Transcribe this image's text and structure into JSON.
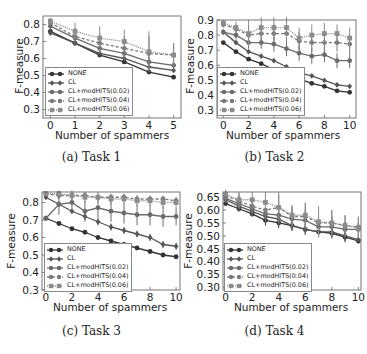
{
  "figure": {
    "xlabel": "Number of spammers",
    "ylabel": "F-measure",
    "legend": [
      "NONE",
      "CL",
      "CL+modHITS(0.02)",
      "CL+modHITS(0.04)",
      "CL+modHITS(0.06)"
    ],
    "series_styles": [
      {
        "color": "#333333",
        "marker": "circle",
        "dash": ""
      },
      {
        "color": "#555555",
        "marker": "diamond",
        "dash": ""
      },
      {
        "color": "#6b6b6b",
        "marker": "circle",
        "dash": ""
      },
      {
        "color": "#7a7a7a",
        "marker": "circle",
        "dash": "3,2"
      },
      {
        "color": "#8c8c8c",
        "marker": "square",
        "dash": "1,1"
      }
    ]
  },
  "panels": [
    {
      "caption": "(a) Task 1"
    },
    {
      "caption": "(b) Task 2"
    },
    {
      "caption": "(c) Task 3"
    },
    {
      "caption": "(d) Task 4"
    }
  ],
  "chart_data": [
    {
      "type": "line",
      "title": "(a) Task 1",
      "xlabel": "Number of spammers",
      "ylabel": "F-measure",
      "x": [
        0,
        1,
        2,
        3,
        4,
        5
      ],
      "xlim": [
        -0.3,
        5.3
      ],
      "xticks": [
        0,
        1,
        2,
        3,
        4,
        5
      ],
      "ylim": [
        0.25,
        0.85
      ],
      "yticks": [
        0.3,
        0.4,
        0.5,
        0.6,
        0.7,
        0.8
      ],
      "ytick_labels": [
        "0.3",
        "0.4",
        "0.5",
        "0.6",
        "0.7",
        "0.8"
      ],
      "legend_position": "lower left",
      "grid": false,
      "series": [
        {
          "name": "NONE",
          "values": [
            0.76,
            0.69,
            0.62,
            0.58,
            0.52,
            0.49
          ],
          "err": [
            0.01,
            0.01,
            0.01,
            0.01,
            0.01,
            0.01
          ]
        },
        {
          "name": "CL",
          "values": [
            0.75,
            0.69,
            0.63,
            0.6,
            0.55,
            0.53
          ],
          "err": [
            0.01,
            0.01,
            0.01,
            0.01,
            0.01,
            0.01
          ]
        },
        {
          "name": "CL+modHITS(0.02)",
          "values": [
            0.79,
            0.72,
            0.66,
            0.63,
            0.58,
            0.56
          ],
          "err": [
            0.02,
            0.02,
            0.03,
            0.03,
            0.03,
            0.03
          ]
        },
        {
          "name": "CL+modHITS(0.04)",
          "values": [
            0.81,
            0.73,
            0.69,
            0.66,
            0.63,
            0.62
          ],
          "err": [
            0.02,
            0.05,
            0.06,
            0.07,
            0.1,
            0.07
          ]
        },
        {
          "name": "CL+modHITS(0.06)",
          "values": [
            0.82,
            0.76,
            0.72,
            0.7,
            0.64,
            0.62
          ],
          "err": [
            0.02,
            0.05,
            0.07,
            0.07,
            0.12,
            0.07
          ]
        }
      ]
    },
    {
      "type": "line",
      "title": "(b) Task 2",
      "xlabel": "Number of spammers",
      "ylabel": "F-measure",
      "x": [
        0,
        1,
        2,
        3,
        4,
        5,
        6,
        7,
        8,
        9,
        10
      ],
      "xlim": [
        -0.5,
        10.5
      ],
      "xticks": [
        0,
        2,
        4,
        6,
        8,
        10
      ],
      "ylim": [
        0.25,
        0.9
      ],
      "yticks": [
        0.3,
        0.4,
        0.5,
        0.6,
        0.7,
        0.8,
        0.9
      ],
      "ytick_labels": [
        "0.3",
        "0.4",
        "0.5",
        "0.6",
        "0.7",
        "0.8",
        "0.9"
      ],
      "legend_position": "lower left",
      "grid": false,
      "series": [
        {
          "name": "NONE",
          "values": [
            0.75,
            0.69,
            0.64,
            0.61,
            0.57,
            0.54,
            0.51,
            0.48,
            0.46,
            0.43,
            0.42
          ],
          "err": [
            0.01,
            0.01,
            0.01,
            0.01,
            0.01,
            0.01,
            0.01,
            0.01,
            0.01,
            0.01,
            0.01
          ]
        },
        {
          "name": "CL",
          "values": [
            0.82,
            0.75,
            0.69,
            0.66,
            0.63,
            0.59,
            0.55,
            0.53,
            0.5,
            0.47,
            0.46
          ],
          "err": [
            0.01,
            0.01,
            0.01,
            0.01,
            0.01,
            0.01,
            0.01,
            0.01,
            0.01,
            0.01,
            0.01
          ]
        },
        {
          "name": "CL+modHITS(0.02)",
          "values": [
            0.82,
            0.8,
            0.75,
            0.75,
            0.74,
            0.71,
            0.68,
            0.66,
            0.67,
            0.63,
            0.63
          ],
          "err": [
            0.02,
            0.03,
            0.04,
            0.04,
            0.05,
            0.05,
            0.05,
            0.05,
            0.05,
            0.05,
            0.05
          ]
        },
        {
          "name": "CL+modHITS(0.04)",
          "values": [
            0.87,
            0.84,
            0.8,
            0.81,
            0.81,
            0.81,
            0.76,
            0.75,
            0.75,
            0.75,
            0.74
          ],
          "err": [
            0.02,
            0.03,
            0.06,
            0.06,
            0.06,
            0.06,
            0.06,
            0.06,
            0.06,
            0.06,
            0.06
          ]
        },
        {
          "name": "CL+modHITS(0.06)",
          "values": [
            0.88,
            0.85,
            0.81,
            0.85,
            0.85,
            0.85,
            0.78,
            0.8,
            0.81,
            0.81,
            0.78
          ],
          "err": [
            0.02,
            0.04,
            0.09,
            0.07,
            0.07,
            0.07,
            0.07,
            0.07,
            0.07,
            0.06,
            0.07
          ]
        }
      ]
    },
    {
      "type": "line",
      "title": "(c) Task 3",
      "xlabel": "Number of spammers",
      "ylabel": "F-measure",
      "x": [
        0,
        1,
        2,
        3,
        4,
        5,
        6,
        7,
        8,
        9,
        10
      ],
      "xlim": [
        -0.3,
        10.3
      ],
      "xticks": [
        0,
        2,
        4,
        6,
        8,
        10
      ],
      "ylim": [
        0.3,
        0.86
      ],
      "yticks": [
        0.3,
        0.4,
        0.5,
        0.6,
        0.7,
        0.8
      ],
      "ytick_labels": [
        "0.3",
        "0.4",
        "0.5",
        "0.6",
        "0.7",
        "0.8"
      ],
      "legend_position": "lower left",
      "grid": false,
      "series": [
        {
          "name": "NONE",
          "values": [
            0.71,
            0.68,
            0.65,
            0.63,
            0.6,
            0.58,
            0.56,
            0.54,
            0.52,
            0.5,
            0.49
          ],
          "err": [
            0.01,
            0.01,
            0.01,
            0.01,
            0.01,
            0.01,
            0.01,
            0.01,
            0.01,
            0.01,
            0.01
          ]
        },
        {
          "name": "CL",
          "values": [
            0.83,
            0.79,
            0.75,
            0.72,
            0.69,
            0.66,
            0.64,
            0.62,
            0.6,
            0.56,
            0.55
          ],
          "err": [
            0.01,
            0.01,
            0.01,
            0.02,
            0.02,
            0.02,
            0.02,
            0.02,
            0.02,
            0.02,
            0.02
          ]
        },
        {
          "name": "CL+modHITS(0.02)",
          "values": [
            0.71,
            0.79,
            0.8,
            0.75,
            0.77,
            0.75,
            0.74,
            0.73,
            0.73,
            0.72,
            0.72
          ],
          "err": [
            0.01,
            0.06,
            0.06,
            0.06,
            0.06,
            0.06,
            0.06,
            0.06,
            0.06,
            0.06,
            0.05
          ]
        },
        {
          "name": "CL+modHITS(0.04)",
          "values": [
            0.85,
            0.84,
            0.84,
            0.84,
            0.83,
            0.83,
            0.83,
            0.82,
            0.82,
            0.82,
            0.81
          ],
          "err": [
            0.01,
            0.02,
            0.02,
            0.02,
            0.02,
            0.02,
            0.02,
            0.02,
            0.02,
            0.02,
            0.02
          ]
        },
        {
          "name": "CL+modHITS(0.06)",
          "values": [
            0.85,
            0.85,
            0.84,
            0.83,
            0.83,
            0.82,
            0.82,
            0.81,
            0.81,
            0.8,
            0.8
          ],
          "err": [
            0.01,
            0.02,
            0.03,
            0.03,
            0.03,
            0.03,
            0.03,
            0.03,
            0.03,
            0.03,
            0.03
          ]
        }
      ]
    },
    {
      "type": "line",
      "title": "(d) Task 4",
      "xlabel": "Number of spammers",
      "ylabel": "F-measure",
      "x": [
        0,
        1,
        2,
        3,
        4,
        5,
        6,
        7,
        8,
        9,
        10
      ],
      "xlim": [
        -0.2,
        10.2
      ],
      "xticks": [
        0,
        2,
        4,
        6,
        8,
        10
      ],
      "ylim": [
        0.29,
        0.67
      ],
      "yticks": [
        0.3,
        0.35,
        0.4,
        0.45,
        0.5,
        0.55,
        0.6,
        0.65
      ],
      "ytick_labels": [
        "0.30",
        "0.35",
        "0.40",
        "0.45",
        "0.50",
        "0.55",
        "0.60",
        "0.65"
      ],
      "legend_position": "lower left",
      "grid": false,
      "series": [
        {
          "name": "NONE",
          "values": [
            0.625,
            0.605,
            0.585,
            0.56,
            0.55,
            0.54,
            0.525,
            0.515,
            0.51,
            0.495,
            0.48
          ],
          "err": [
            0.01,
            0.01,
            0.01,
            0.02,
            0.02,
            0.02,
            0.02,
            0.02,
            0.02,
            0.02,
            0.01
          ]
        },
        {
          "name": "CL",
          "values": [
            0.64,
            0.615,
            0.595,
            0.575,
            0.565,
            0.54,
            0.525,
            0.515,
            0.515,
            0.5,
            0.485
          ],
          "err": [
            0.01,
            0.01,
            0.01,
            0.02,
            0.02,
            0.02,
            0.02,
            0.02,
            0.02,
            0.02,
            0.01
          ]
        },
        {
          "name": "CL+modHITS(0.02)",
          "values": [
            0.645,
            0.625,
            0.605,
            0.585,
            0.58,
            0.565,
            0.56,
            0.535,
            0.535,
            0.525,
            0.525
          ],
          "err": [
            0.02,
            0.03,
            0.03,
            0.03,
            0.04,
            0.04,
            0.04,
            0.04,
            0.04,
            0.03,
            0.03
          ]
        },
        {
          "name": "CL+modHITS(0.04)",
          "values": [
            0.655,
            0.635,
            0.615,
            0.6,
            0.61,
            0.575,
            0.575,
            0.55,
            0.55,
            0.54,
            0.535
          ],
          "err": [
            0.02,
            0.03,
            0.03,
            0.04,
            0.05,
            0.04,
            0.05,
            0.05,
            0.05,
            0.04,
            0.04
          ]
        },
        {
          "name": "CL+modHITS(0.06)",
          "values": [
            0.66,
            0.64,
            0.64,
            0.63,
            0.61,
            0.58,
            0.58,
            0.555,
            0.55,
            0.54,
            0.53
          ],
          "err": [
            0.02,
            0.03,
            0.03,
            0.04,
            0.06,
            0.04,
            0.05,
            0.06,
            0.05,
            0.04,
            0.04
          ]
        }
      ]
    }
  ]
}
